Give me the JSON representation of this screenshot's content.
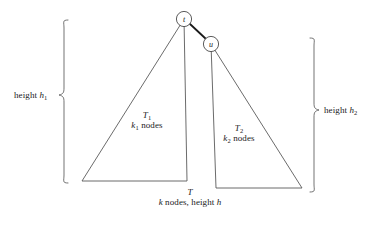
{
  "figure": {
    "type": "tree-diagram",
    "colors": {
      "stroke": "#4a4a4a",
      "text": "#1a1a1a",
      "background": "#ffffff",
      "edge_thick": "#1a1a1a"
    }
  },
  "nodes": [
    {
      "id": "t",
      "label": "t",
      "cx": 184,
      "cy": 19,
      "r": 8
    },
    {
      "id": "u",
      "label": "u",
      "cx": 211,
      "cy": 44,
      "r": 8
    }
  ],
  "subtrees": [
    {
      "id": "T1",
      "name": "T",
      "name_sub": "1",
      "count_var": "k",
      "count_sub": "1",
      "count_word": "nodes",
      "apex": [
        184,
        19
      ],
      "base_left": [
        82,
        181
      ],
      "base_right": [
        187,
        181
      ]
    },
    {
      "id": "T2",
      "name": "T",
      "name_sub": "2",
      "count_var": "k",
      "count_sub": "2",
      "count_word": "nodes",
      "apex": [
        211,
        44
      ],
      "base_left": [
        216,
        188
      ],
      "base_right": [
        302,
        188
      ]
    }
  ],
  "braces": [
    {
      "id": "height-h1-brace",
      "side": "left",
      "label_prefix": "height ",
      "label_var": "h",
      "label_sub": "1",
      "span_top": 20,
      "span_bottom": 183
    },
    {
      "id": "height-h2-brace",
      "side": "right",
      "label_prefix": "height ",
      "label_var": "h",
      "label_sub": "2",
      "span_top": 38,
      "span_bottom": 192
    }
  ],
  "caption": {
    "tree_name": "T",
    "detail_prefix": "k",
    "detail_text": " nodes, height ",
    "detail_height_var": "h"
  }
}
